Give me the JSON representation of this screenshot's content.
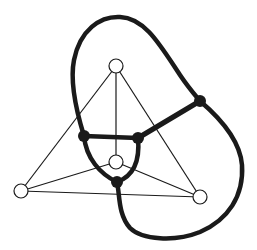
{
  "diagram": {
    "type": "planar-graph-with-dual",
    "colors": {
      "background": "#ffffff",
      "primal_edge": "#1a1a1a",
      "primal_vertex_fill": "#ffffff",
      "primal_vertex_stroke": "#1a1a1a",
      "dual_edge": "#1a1a1a",
      "dual_vertex_fill": "#1a1a1a"
    },
    "primal_graph": {
      "vertices": [
        {
          "id": "top",
          "x": 116,
          "y": 66
        },
        {
          "id": "left",
          "x": 21,
          "y": 191
        },
        {
          "id": "right",
          "x": 200,
          "y": 197
        },
        {
          "id": "center",
          "x": 116,
          "y": 162
        }
      ],
      "edges": [
        [
          "top",
          "left"
        ],
        [
          "top",
          "right"
        ],
        [
          "top",
          "center"
        ],
        [
          "left",
          "right"
        ],
        [
          "left",
          "center"
        ],
        [
          "right",
          "center"
        ]
      ]
    },
    "dual_graph": {
      "vertices": [
        {
          "id": "d-left",
          "x": 84,
          "y": 136
        },
        {
          "id": "d-mid",
          "x": 138,
          "y": 138
        },
        {
          "id": "d-bottom",
          "x": 117,
          "y": 182
        },
        {
          "id": "d-outer",
          "x": 200,
          "y": 101
        }
      ],
      "edges": [
        {
          "from": "d-left",
          "to": "d-mid",
          "shape": "straight"
        },
        {
          "from": "d-mid",
          "to": "d-outer",
          "shape": "straight"
        },
        {
          "from": "d-left",
          "to": "d-bottom",
          "shape": "curve"
        },
        {
          "from": "d-mid",
          "to": "d-bottom",
          "shape": "curve"
        },
        {
          "from": "d-left",
          "to": "d-outer",
          "shape": "outer-arc-top"
        },
        {
          "from": "d-bottom",
          "to": "d-outer",
          "shape": "outer-arc-bottom-right"
        }
      ]
    }
  }
}
